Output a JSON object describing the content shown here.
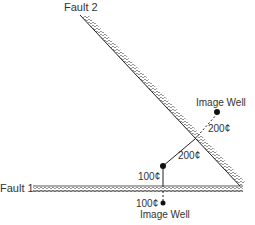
{
  "diagram": {
    "fault2_label": "Fault 2",
    "fault1_label": "Fault 1",
    "image_well_top_label": "Image Well",
    "image_well_bottom_label": "Image Well",
    "distance_dashed_fault2": "200¢",
    "distance_solid_fault2": "200¢",
    "distance_solid_fault1": "100¢",
    "distance_dashed_fault1": "100¢",
    "colors": {
      "line": "#222222",
      "hatch": "#555555",
      "text": "#333333"
    }
  }
}
